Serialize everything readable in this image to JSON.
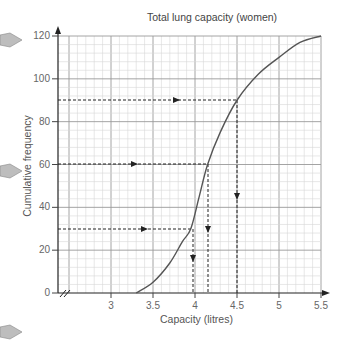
{
  "page": {
    "top_clipped_text": "estimates ?..."
  },
  "chart_data": {
    "type": "line",
    "title": "Total lung capacity (women)",
    "xlabel": "Capacity (litres)",
    "ylabel": "Cumulative frequency",
    "x_ticks": [
      "3",
      "3.5",
      "4",
      "4.5",
      "5",
      "5.5"
    ],
    "y_ticks": [
      "0",
      "20",
      "40",
      "60",
      "80",
      "100",
      "120"
    ],
    "xlim": [
      2.5,
      5.5
    ],
    "ylim": [
      0,
      120
    ],
    "grid": true,
    "axis_break": "x-axis broken near origin (//)",
    "series": [
      {
        "name": "Cumulative frequency curve",
        "x": [
          3.3,
          3.5,
          3.7,
          3.85,
          3.95,
          4.05,
          4.15,
          4.3,
          4.5,
          4.75,
          5.0,
          5.25,
          5.5
        ],
        "y": [
          0,
          5,
          14,
          24,
          30,
          45,
          60,
          75,
          90,
          102,
          110,
          117,
          120
        ]
      }
    ],
    "annotations": [
      {
        "type": "dashed-lookup",
        "from_y": 30,
        "to_x": 3.96,
        "label": "lower quartile"
      },
      {
        "type": "dashed-lookup",
        "from_y": 60,
        "to_x": 4.15,
        "label": "median"
      },
      {
        "type": "dashed-lookup",
        "from_y": 90,
        "to_x": 4.5,
        "label": "upper quartile"
      }
    ]
  },
  "margin_markers": [
    "triangle",
    "triangle",
    "triangle"
  ]
}
